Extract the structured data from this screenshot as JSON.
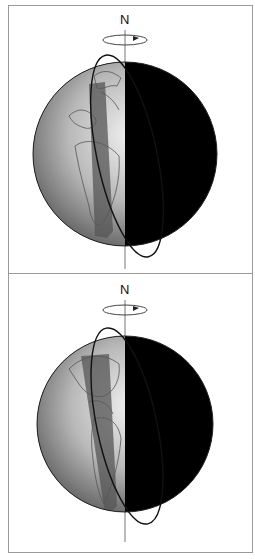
{
  "diagram": {
    "panels": [
      {
        "id": "top",
        "north_label": "N",
        "rotation_direction": "counterclockwise-arrow",
        "description": "Globe with day side (left, gray continents: Europe/Africa) and night side (right, black), orbit ellipse around the axis"
      },
      {
        "id": "bottom",
        "north_label": "N",
        "rotation_direction": "counterclockwise-arrow",
        "description": "Globe with day side (left, gray continents: Americas) and night side (right, black), orbit ellipse around the axis"
      }
    ],
    "colors": {
      "night": "#000000",
      "day_light": "#e8e8e8",
      "day_dark": "#7a7a7a",
      "swath": "#555555",
      "border": "#9a9a9a"
    }
  }
}
